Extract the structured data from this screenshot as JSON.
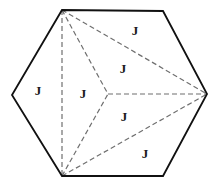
{
  "figure": {
    "background_color": "#ffffff",
    "width": 220,
    "height": 190,
    "outline": {
      "name": "hexagon-outline",
      "color": "#111111",
      "stroke_width": 1.8,
      "style": "solid",
      "points": "62,10 163,11 207,94 163,176 62,176 12,95"
    },
    "vertices": [
      {
        "id": "v-top-left",
        "label": "",
        "x": 62,
        "y": 10
      },
      {
        "id": "v-top-right",
        "label": "",
        "x": 163,
        "y": 11
      },
      {
        "id": "v-right",
        "label": "",
        "x": 207,
        "y": 94
      },
      {
        "id": "v-bottom-right",
        "label": "",
        "x": 163,
        "y": 176
      },
      {
        "id": "v-bottom-left",
        "label": "",
        "x": 62,
        "y": 176
      },
      {
        "id": "v-left",
        "label": "",
        "x": 12,
        "y": 95
      },
      {
        "id": "v-center",
        "label": "",
        "x": 108,
        "y": 94
      }
    ],
    "diagonals": {
      "color": "#6f6f6f",
      "stroke_width": 1.2,
      "style": "dashed",
      "dash_pattern": "5,3",
      "segments": [
        {
          "id": "diag-topleft-bottomleft",
          "x1": 62,
          "y1": 10,
          "x2": 62,
          "y2": 176
        },
        {
          "id": "diag-topleft-center",
          "x1": 62,
          "y1": 10,
          "x2": 108,
          "y2": 94
        },
        {
          "id": "diag-topleft-right",
          "x1": 62,
          "y1": 10,
          "x2": 207,
          "y2": 94
        },
        {
          "id": "diag-bottomleft-center",
          "x1": 62,
          "y1": 176,
          "x2": 108,
          "y2": 94
        },
        {
          "id": "diag-bottomleft-right",
          "x1": 62,
          "y1": 176,
          "x2": 207,
          "y2": 94
        },
        {
          "id": "diag-center-right",
          "x1": 108,
          "y1": 94,
          "x2": 207,
          "y2": 94
        }
      ]
    },
    "region_labels": [
      {
        "id": "label-left",
        "text": "J",
        "x": 38,
        "y": 92
      },
      {
        "id": "label-center-left",
        "text": "J",
        "x": 83,
        "y": 95
      },
      {
        "id": "label-top",
        "text": "J",
        "x": 135,
        "y": 32
      },
      {
        "id": "label-upper-middle",
        "text": "J",
        "x": 123,
        "y": 70
      },
      {
        "id": "label-lower-middle",
        "text": "J",
        "x": 124,
        "y": 118
      },
      {
        "id": "label-bottom",
        "text": "J",
        "x": 145,
        "y": 155
      }
    ]
  }
}
